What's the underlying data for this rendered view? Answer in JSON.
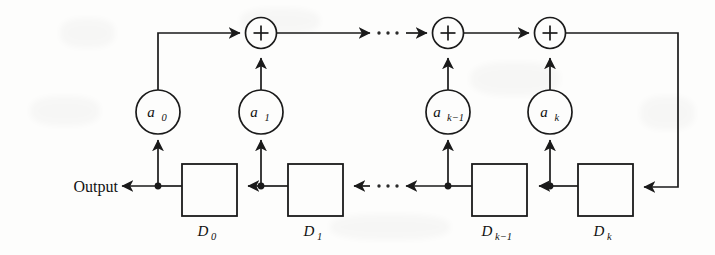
{
  "figure": {
    "kind": "block-diagram",
    "background_color": "#fdfdfc",
    "line_color": "#1a1a1a",
    "output_label": "Output",
    "ellipsis_glyph": "· · ·"
  },
  "coefficients": [
    {
      "id": "a0",
      "base": "a",
      "sub": "0"
    },
    {
      "id": "a1",
      "base": "a",
      "sub": "1"
    },
    {
      "id": "ak1",
      "base": "a",
      "sub": "k−1"
    },
    {
      "id": "ak",
      "base": "a",
      "sub": "k"
    }
  ],
  "delays": [
    {
      "id": "D0",
      "base": "D",
      "sub": "0"
    },
    {
      "id": "D1",
      "base": "D",
      "sub": "1"
    },
    {
      "id": "Dk1",
      "base": "D",
      "sub": "k−1"
    },
    {
      "id": "Dk",
      "base": "D",
      "sub": "k"
    }
  ],
  "adders": [
    {
      "id": "adder-1",
      "symbol": "+"
    },
    {
      "id": "adder-2",
      "symbol": "+"
    },
    {
      "id": "adder-3",
      "symbol": "+"
    },
    {
      "id": "adder-4",
      "symbol": "+"
    }
  ]
}
